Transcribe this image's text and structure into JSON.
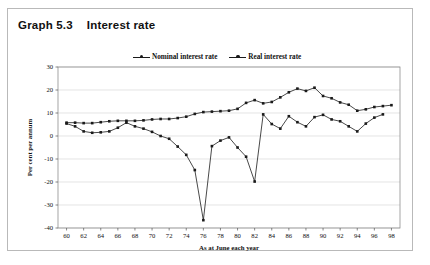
{
  "figure": {
    "number": "Graph 5.3",
    "title": "Interest rate"
  },
  "legend": {
    "position": "top-center",
    "entries": [
      {
        "label": "Nominal interest rate",
        "marker": "line-dot-marker",
        "color": "#1a1a1a"
      },
      {
        "label": "Real interest rate",
        "marker": "line-dot-marker",
        "color": "#1a1a1a"
      }
    ]
  },
  "axes": {
    "y_label": "Per cent per annum",
    "x_label": "As at June each year",
    "y_ticks": [
      "30",
      "20",
      "10",
      "0",
      "-10",
      "-20",
      "-30",
      "-40"
    ],
    "x_ticks": [
      "60",
      "62",
      "64",
      "66",
      "68",
      "70",
      "72",
      "74",
      "76",
      "78",
      "80",
      "82",
      "84",
      "86",
      "88",
      "90",
      "92",
      "94",
      "96",
      "98"
    ]
  },
  "chart_data": {
    "type": "line",
    "title": "Interest rate",
    "subtitle": "Graph 5.3",
    "xlabel": "As at June each year",
    "ylabel": "Per cent per annum",
    "xlim": [
      59,
      99
    ],
    "ylim": [
      -40,
      30
    ],
    "ytick_step": 10,
    "xtick_step": 2,
    "grid": "horizontal",
    "legend_position": "top-center",
    "x": [
      60,
      61,
      62,
      63,
      64,
      65,
      66,
      67,
      68,
      69,
      70,
      71,
      72,
      73,
      74,
      75,
      76,
      77,
      78,
      79,
      80,
      81,
      82,
      83,
      84,
      85,
      86,
      87,
      88,
      89,
      90,
      91,
      92,
      93,
      94,
      95,
      96,
      97,
      98
    ],
    "series": [
      {
        "name": "Nominal interest rate",
        "color": "#1a1a1a",
        "values": [
          5.8,
          5.8,
          5.6,
          5.6,
          6.0,
          6.4,
          6.6,
          6.6,
          6.6,
          6.8,
          7.2,
          7.4,
          7.4,
          7.8,
          8.4,
          9.6,
          10.4,
          10.6,
          10.8,
          11.0,
          11.8,
          14.4,
          15.6,
          14.2,
          14.8,
          16.8,
          19.0,
          20.6,
          19.6,
          21.0,
          17.4,
          16.4,
          14.6,
          13.6,
          11.0,
          11.6,
          12.6,
          13.0,
          13.4
        ]
      },
      {
        "name": "Real interest rate",
        "color": "#1a1a1a",
        "values": [
          5.4,
          4.2,
          2.0,
          1.4,
          1.6,
          2.0,
          3.6,
          5.8,
          4.2,
          3.2,
          1.8,
          0.0,
          -1.2,
          -4.6,
          -8.2,
          -14.8,
          -36.6,
          -4.4,
          -2.0,
          -0.6,
          -5.0,
          -9.0,
          -19.8,
          9.4,
          5.2,
          3.2,
          8.6,
          6.0,
          4.2,
          8.2,
          9.2,
          7.2,
          6.4,
          4.2,
          2.0,
          5.4,
          8.0,
          9.4,
          null
        ]
      }
    ]
  }
}
